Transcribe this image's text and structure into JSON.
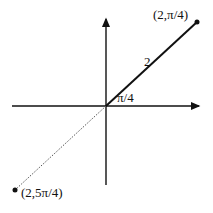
{
  "diagram": {
    "type": "polar-coordinates",
    "labels": {
      "point_upper": "(2,π/4)",
      "point_lower": "(2,5π/4)",
      "radius": "2",
      "angle": "π/4"
    },
    "points": [
      {
        "label": "(2,π/4)",
        "r": 2,
        "theta": "π/4"
      },
      {
        "label": "(2,5π/4)",
        "r": 2,
        "theta": "5π/4"
      }
    ],
    "colors": {
      "ink": "#111111",
      "dotted": "#555555"
    }
  }
}
